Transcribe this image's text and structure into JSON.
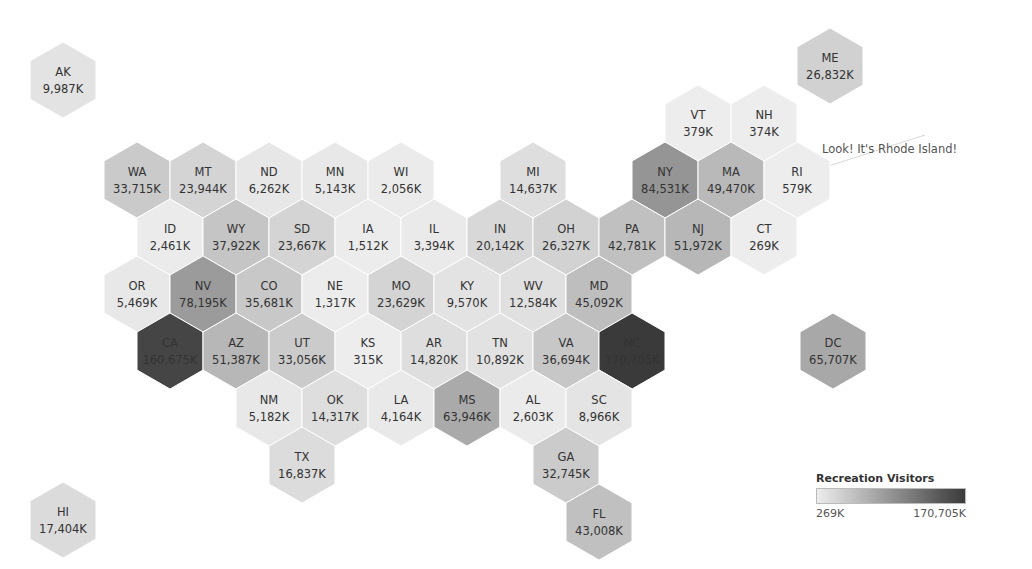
{
  "chart_data": {
    "type": "heatmap",
    "subtype": "hex-tile-map",
    "title": "",
    "measure": "Recreation Visitors",
    "units": "K (thousands)",
    "color_scale": {
      "min": 269,
      "max": 170705,
      "min_label": "269K",
      "max_label": "170,705K",
      "min_color": "#ededed",
      "max_color": "#3a3a3a"
    },
    "annotation": {
      "text": "Look! It's Rhode Island!",
      "target": "RI"
    },
    "states": [
      {
        "code": "AK",
        "value": 9987,
        "label": "9,987K"
      },
      {
        "code": "ME",
        "value": 26832,
        "label": "26,832K"
      },
      {
        "code": "VT",
        "value": 379,
        "label": "379K"
      },
      {
        "code": "NH",
        "value": 374,
        "label": "374K"
      },
      {
        "code": "WA",
        "value": 33715,
        "label": "33,715K"
      },
      {
        "code": "MT",
        "value": 23944,
        "label": "23,944K"
      },
      {
        "code": "ND",
        "value": 6262,
        "label": "6,262K"
      },
      {
        "code": "MN",
        "value": 5143,
        "label": "5,143K"
      },
      {
        "code": "WI",
        "value": 2056,
        "label": "2,056K"
      },
      {
        "code": "MI",
        "value": 14637,
        "label": "14,637K"
      },
      {
        "code": "NY",
        "value": 84531,
        "label": "84,531K"
      },
      {
        "code": "MA",
        "value": 49470,
        "label": "49,470K"
      },
      {
        "code": "RI",
        "value": 579,
        "label": "579K"
      },
      {
        "code": "ID",
        "value": 2461,
        "label": "2,461K"
      },
      {
        "code": "WY",
        "value": 37922,
        "label": "37,922K"
      },
      {
        "code": "SD",
        "value": 23667,
        "label": "23,667K"
      },
      {
        "code": "IA",
        "value": 1512,
        "label": "1,512K"
      },
      {
        "code": "IL",
        "value": 3394,
        "label": "3,394K"
      },
      {
        "code": "IN",
        "value": 20142,
        "label": "20,142K"
      },
      {
        "code": "OH",
        "value": 26327,
        "label": "26,327K"
      },
      {
        "code": "PA",
        "value": 42781,
        "label": "42,781K"
      },
      {
        "code": "NJ",
        "value": 51972,
        "label": "51,972K"
      },
      {
        "code": "CT",
        "value": 269,
        "label": "269K"
      },
      {
        "code": "OR",
        "value": 5469,
        "label": "5,469K"
      },
      {
        "code": "NV",
        "value": 78195,
        "label": "78,195K"
      },
      {
        "code": "CO",
        "value": 35681,
        "label": "35,681K"
      },
      {
        "code": "NE",
        "value": 1317,
        "label": "1,317K"
      },
      {
        "code": "MO",
        "value": 23629,
        "label": "23,629K"
      },
      {
        "code": "KY",
        "value": 9570,
        "label": "9,570K"
      },
      {
        "code": "WV",
        "value": 12584,
        "label": "12,584K"
      },
      {
        "code": "MD",
        "value": 45092,
        "label": "45,092K"
      },
      {
        "code": "CA",
        "value": 160675,
        "label": "160,675K"
      },
      {
        "code": "AZ",
        "value": 51387,
        "label": "51,387K"
      },
      {
        "code": "UT",
        "value": 33056,
        "label": "33,056K"
      },
      {
        "code": "KS",
        "value": 315,
        "label": "315K"
      },
      {
        "code": "AR",
        "value": 14820,
        "label": "14,820K"
      },
      {
        "code": "TN",
        "value": 10892,
        "label": "10,892K"
      },
      {
        "code": "VA",
        "value": 36694,
        "label": "36,694K"
      },
      {
        "code": "NC",
        "value": 170705,
        "label": "170,705K"
      },
      {
        "code": "DC",
        "value": 65707,
        "label": "65,707K"
      },
      {
        "code": "NM",
        "value": 5182,
        "label": "5,182K"
      },
      {
        "code": "OK",
        "value": 14317,
        "label": "14,317K"
      },
      {
        "code": "LA",
        "value": 4164,
        "label": "4,164K"
      },
      {
        "code": "MS",
        "value": 63946,
        "label": "63,946K"
      },
      {
        "code": "AL",
        "value": 2603,
        "label": "2,603K"
      },
      {
        "code": "SC",
        "value": 8966,
        "label": "8,966K"
      },
      {
        "code": "TX",
        "value": 16837,
        "label": "16,837K"
      },
      {
        "code": "GA",
        "value": 32745,
        "label": "32,745K"
      },
      {
        "code": "FL",
        "value": 43008,
        "label": "43,008K"
      },
      {
        "code": "HI",
        "value": 17404,
        "label": "17,404K"
      }
    ]
  },
  "layout": {
    "AK": [
      63,
      80
    ],
    "ME": [
      830,
      66
    ],
    "VT": [
      698,
      123
    ],
    "NH": [
      764,
      123
    ],
    "WA": [
      137,
      180
    ],
    "MT": [
      203,
      180
    ],
    "ND": [
      269,
      180
    ],
    "MN": [
      335,
      180
    ],
    "WI": [
      401,
      180
    ],
    "MI": [
      533,
      180
    ],
    "NY": [
      665,
      180
    ],
    "MA": [
      731,
      180
    ],
    "RI": [
      797,
      180
    ],
    "ID": [
      170,
      237
    ],
    "WY": [
      236,
      237
    ],
    "SD": [
      302,
      237
    ],
    "IA": [
      368,
      237
    ],
    "IL": [
      434,
      237
    ],
    "IN": [
      500,
      237
    ],
    "OH": [
      566,
      237
    ],
    "PA": [
      632,
      237
    ],
    "NJ": [
      698,
      237
    ],
    "CT": [
      764,
      237
    ],
    "OR": [
      137,
      294
    ],
    "NV": [
      203,
      294
    ],
    "CO": [
      269,
      294
    ],
    "NE": [
      335,
      294
    ],
    "MO": [
      401,
      294
    ],
    "KY": [
      467,
      294
    ],
    "WV": [
      533,
      294
    ],
    "MD": [
      599,
      294
    ],
    "CA": [
      170,
      351
    ],
    "AZ": [
      236,
      351
    ],
    "UT": [
      302,
      351
    ],
    "KS": [
      368,
      351
    ],
    "AR": [
      434,
      351
    ],
    "TN": [
      500,
      351
    ],
    "VA": [
      566,
      351
    ],
    "NC": [
      632,
      351
    ],
    "DC": [
      833,
      351
    ],
    "NM": [
      269,
      408
    ],
    "OK": [
      335,
      408
    ],
    "LA": [
      401,
      408
    ],
    "MS": [
      467,
      408
    ],
    "AL": [
      533,
      408
    ],
    "SC": [
      599,
      408
    ],
    "TX": [
      302,
      465
    ],
    "GA": [
      566,
      465
    ],
    "FL": [
      599,
      522
    ],
    "HI": [
      63,
      520
    ]
  },
  "legend": {
    "title": "Recreation Visitors",
    "min_label": "269K",
    "max_label": "170,705K"
  },
  "annotation": {
    "text": "Look! It's Rhode Island!"
  }
}
